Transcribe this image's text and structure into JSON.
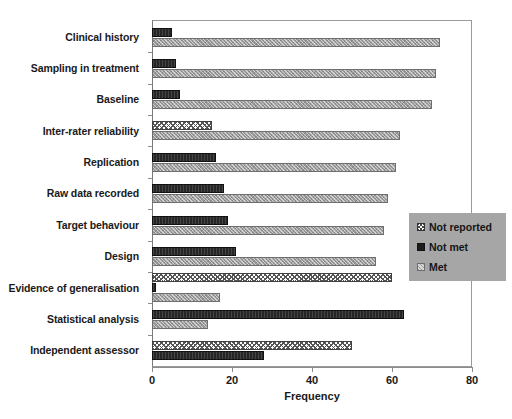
{
  "chart_data": {
    "type": "bar",
    "orientation": "horizontal",
    "title": "",
    "xlabel": "Frequency",
    "ylabel": "",
    "xlim": [
      0,
      80
    ],
    "xticks": [
      0,
      20,
      40,
      60,
      80
    ],
    "grid": false,
    "legend_position": "right-middle",
    "categories": [
      "Clinical history",
      "Sampling in treatment",
      "Baseline",
      "Inter-rater reliability",
      "Replication",
      "Raw data recorded",
      "Target behaviour",
      "Design",
      "Evidence of generalisation",
      "Statistical analysis",
      "Independent assessor"
    ],
    "series": [
      {
        "name": "Not reported",
        "color": "#ffffff",
        "values": [
          0,
          0,
          0,
          15,
          0,
          0,
          0,
          0,
          60,
          0,
          50
        ]
      },
      {
        "name": "Not met",
        "color": "#262626",
        "values": [
          5,
          6,
          7,
          0,
          16,
          18,
          19,
          21,
          1,
          63,
          28
        ]
      },
      {
        "name": "Met",
        "color": "#9d9d9d",
        "values": [
          72,
          71,
          70,
          62,
          61,
          59,
          58,
          56,
          17,
          14,
          0
        ]
      }
    ]
  },
  "legend": {
    "items": [
      {
        "label": "Not reported",
        "swatch": "notreported"
      },
      {
        "label": "Not met",
        "swatch": "notmet"
      },
      {
        "label": "Met",
        "swatch": "met"
      }
    ]
  },
  "axis": {
    "x_title": "Frequency",
    "x_tick_labels": [
      "0",
      "20",
      "40",
      "60",
      "80"
    ]
  }
}
